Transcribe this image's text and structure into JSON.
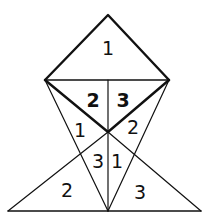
{
  "diagram": {
    "labels": {
      "top": "1",
      "upper_left": "2",
      "upper_right": "3",
      "mid_left": "1",
      "mid_right": "2",
      "center_left": "3",
      "center_right": "1",
      "bottom_left": "2",
      "bottom_right": "3"
    },
    "colors": {
      "stroke": "#111111",
      "background": "#ffffff"
    }
  }
}
